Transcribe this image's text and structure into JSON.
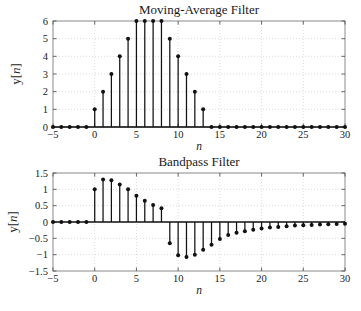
{
  "figure": {
    "background_color": "#ffffff",
    "axis_color": "#8a8a8a",
    "grid_color": "#cccccc",
    "data_color": "#111111"
  },
  "chart_data": [
    {
      "type": "stem",
      "panel": "top",
      "title": "Moving-Average Filter",
      "xlabel": "n",
      "ylabel": "y[n]",
      "xlim": [
        -5,
        30
      ],
      "ylim": [
        0,
        6
      ],
      "xticks": [
        -5,
        0,
        5,
        10,
        15,
        20,
        25,
        30
      ],
      "xticklabels": [
        "−5",
        "0",
        "5",
        "10",
        "15",
        "20",
        "25",
        "30"
      ],
      "yticks": [
        0,
        1,
        2,
        3,
        4,
        5,
        6
      ],
      "yticklabels": [
        "0",
        "1",
        "2",
        "3",
        "4",
        "5",
        "6"
      ],
      "grid": true,
      "legend": "none",
      "x": [
        -5,
        -4,
        -3,
        -2,
        -1,
        0,
        1,
        2,
        3,
        4,
        5,
        6,
        7,
        8,
        9,
        10,
        11,
        12,
        13,
        14,
        15,
        16,
        17,
        18,
        19,
        20,
        21,
        22,
        23,
        24,
        25,
        26,
        27,
        28,
        29,
        30
      ],
      "values": [
        0,
        0,
        0,
        0,
        0,
        1,
        2,
        3,
        4,
        5,
        6,
        6,
        6,
        6,
        5,
        4,
        3,
        2,
        1,
        0,
        0,
        0,
        0,
        0,
        0,
        0,
        0,
        0,
        0,
        0,
        0,
        0,
        0,
        0,
        0,
        0
      ]
    },
    {
      "type": "stem",
      "panel": "bottom",
      "title": "Bandpass Filter",
      "xlabel": "n",
      "ylabel": "y[n]",
      "xlim": [
        -5,
        30
      ],
      "ylim": [
        -1.5,
        1.5
      ],
      "xticks": [
        -5,
        0,
        5,
        10,
        15,
        20,
        25,
        30
      ],
      "xticklabels": [
        "−5",
        "0",
        "5",
        "10",
        "15",
        "20",
        "25",
        "30"
      ],
      "yticks": [
        -1.5,
        -1,
        -0.5,
        0,
        0.5,
        1,
        1.5
      ],
      "yticklabels": [
        "−1.5",
        "−1",
        "−0.5",
        "0",
        "0.5",
        "1",
        "1.5"
      ],
      "grid": true,
      "legend": "none",
      "x": [
        -5,
        -4,
        -3,
        -2,
        -1,
        0,
        1,
        2,
        3,
        4,
        5,
        6,
        7,
        8,
        9,
        10,
        11,
        12,
        13,
        14,
        15,
        16,
        17,
        18,
        19,
        20,
        21,
        22,
        23,
        24,
        25,
        26,
        27,
        28,
        29,
        30
      ],
      "values": [
        0,
        0,
        0,
        0,
        0,
        1.0,
        1.3,
        1.28,
        1.15,
        1.0,
        0.8,
        0.65,
        0.52,
        0.42,
        -0.65,
        -1.02,
        -1.07,
        -1.0,
        -0.85,
        -0.7,
        -0.52,
        -0.4,
        -0.33,
        -0.28,
        -0.24,
        -0.2,
        -0.17,
        -0.15,
        -0.13,
        -0.11,
        -0.1,
        -0.09,
        -0.08,
        -0.07,
        -0.06,
        -0.05
      ]
    }
  ]
}
